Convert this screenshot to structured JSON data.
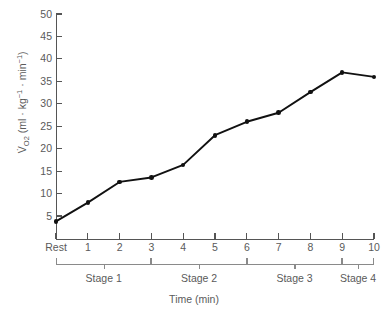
{
  "chart_data": {
    "type": "line",
    "title": "",
    "xlabel": "Time (min)",
    "ylabel": "V̇O2 (ml · kg-1 · min-1)",
    "ylabel_parts": {
      "v": "V̇",
      "sub": "O",
      "sub2": "2",
      "rest": " (ml · kg",
      "sup1": "−1",
      "mid": " · min",
      "sup2": "−1",
      "close": ")"
    },
    "categories": [
      "Rest",
      "1",
      "2",
      "3",
      "4",
      "5",
      "6",
      "7",
      "8",
      "9",
      "10"
    ],
    "x": [
      0,
      1,
      2,
      3,
      4,
      5,
      6,
      7,
      8,
      9,
      10
    ],
    "values": [
      3.8,
      8.0,
      12.6,
      13.6,
      16.4,
      23.0,
      26.0,
      28.0,
      32.6,
      37.0,
      36.0
    ],
    "ylim": [
      0,
      50
    ],
    "xlim": [
      0,
      10
    ],
    "yticks": [
      5,
      10,
      15,
      20,
      25,
      30,
      35,
      40,
      45,
      50
    ],
    "ytick_labels": [
      "5",
      "10",
      "15",
      "20",
      "25",
      "30",
      "35",
      "40",
      "45",
      "50"
    ],
    "xtick_labels": [
      "Rest",
      "1",
      "2",
      "3",
      "4",
      "5",
      "6",
      "7",
      "8",
      "9",
      "10"
    ],
    "grid": false,
    "legend": "none",
    "marker": "filled-circle",
    "line_color": "#111111",
    "marker_color": "#111111",
    "axis_color": "#555555",
    "annotations": [
      {
        "label": "Stage 1",
        "from": 0,
        "to": 3
      },
      {
        "label": "Stage 2",
        "from": 3,
        "to": 6
      },
      {
        "label": "Stage 3",
        "from": 6,
        "to": 9
      },
      {
        "label": "Stage 4",
        "from": 9,
        "to": 10
      }
    ]
  }
}
